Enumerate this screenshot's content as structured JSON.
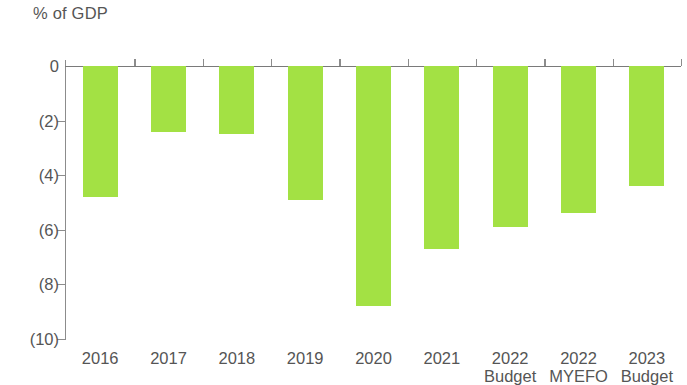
{
  "chart_data": {
    "type": "bar",
    "title": "",
    "subtitle": "",
    "xlabel": "",
    "ylabel": "% of GDP",
    "categories": [
      "2016",
      "2017",
      "2018",
      "2019",
      "2020",
      "2021",
      "2022 Budget",
      "2022 MYEFO",
      "2023 Budget"
    ],
    "category_lines": [
      [
        "2016"
      ],
      [
        "2017"
      ],
      [
        "2018"
      ],
      [
        "2019"
      ],
      [
        "2020"
      ],
      [
        "2021"
      ],
      [
        "2022",
        "Budget"
      ],
      [
        "2022",
        "MYEFO"
      ],
      [
        "2023",
        "Budget"
      ]
    ],
    "values": [
      -4.8,
      -2.4,
      -2.5,
      -4.9,
      -8.8,
      -6.7,
      -5.9,
      -5.4,
      -4.4
    ],
    "ylim": [
      -10,
      0
    ],
    "ytick_values": [
      0,
      -2,
      -4,
      -6,
      -8,
      -10
    ],
    "ytick_labels": [
      "0",
      "(2)",
      "(4)",
      "(6)",
      "(8)",
      "(10)"
    ],
    "grid": false,
    "legend": "none",
    "bar_color": "#a3e144",
    "axis_color": "#8c8c8c",
    "text_color": "#555555"
  }
}
